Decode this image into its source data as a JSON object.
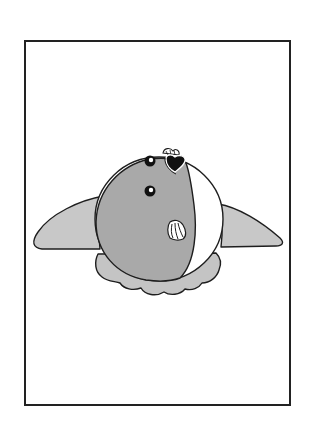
{
  "illustration": {
    "caption": "Cartoon round fish-like creature with two side fins, a scalloped skirt at the base, two eyes and a dark heart-shaped mark, drawn inside a rectangular frame",
    "colors": {
      "background": "#ffffff",
      "frame_stroke": "#222222",
      "outline": "#1e1e1e",
      "body_fill": "#a9a9a9",
      "fin_fill": "#c8c8c8",
      "skirt_fill": "#c4c4c4",
      "belly_fill": "#ffffff",
      "eye_fill": "#111111",
      "eye_highlight": "#ffffff",
      "mark_fill": "#111111"
    },
    "frame": {
      "x": 25,
      "y": 41,
      "width": 265,
      "height": 364,
      "stroke_width": 2
    }
  }
}
